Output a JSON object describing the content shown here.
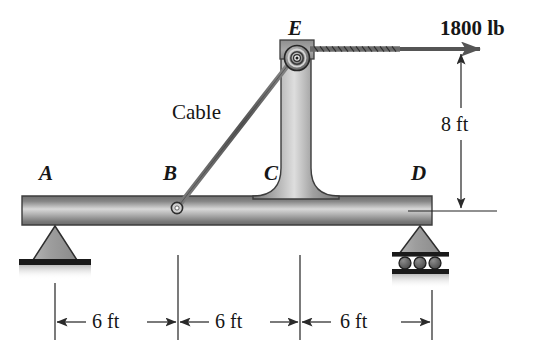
{
  "figure": {
    "type": "free-body-diagram",
    "point_labels": [
      {
        "name": "A",
        "text": "A",
        "x": 39,
        "y": 173
      },
      {
        "name": "B",
        "text": "B",
        "x": 163,
        "y": 173
      },
      {
        "name": "C",
        "text": "C",
        "x": 264,
        "y": 173
      },
      {
        "name": "D",
        "text": "D",
        "x": 411,
        "y": 173
      },
      {
        "name": "E",
        "text": "E",
        "x": 288,
        "y": 22
      }
    ],
    "cable_label": {
      "text": "Cable",
      "x": 175,
      "y": 108
    },
    "force_label": {
      "text": "1800 lb",
      "x": 443,
      "y": 24
    },
    "vertical_dimension": {
      "text": "8 ft",
      "x": 450,
      "y": 125
    },
    "horizontal_dimensions": [
      {
        "text": "6 ft",
        "x": 100,
        "y": 310
      },
      {
        "text": "6 ft",
        "x": 223,
        "y": 310
      },
      {
        "text": "6 ft",
        "x": 345,
        "y": 310
      }
    ],
    "colors": {
      "outline": "#3a3a3a",
      "metal_dark": "#6d6d6d",
      "metal_light": "#e6e6e6",
      "metal_mid": "#9a9a9a",
      "support_fill": "#9d9d9d",
      "ground": "#1c1c1c",
      "cable": "#5a5a5a",
      "dimension_line": "#222222",
      "text": "#161616"
    },
    "geometry": {
      "beam": {
        "x1": 22,
        "y1": 196,
        "x2": 432,
        "y2": 225
      },
      "column": {
        "x1": 281,
        "y1": 42,
        "x2": 311,
        "y2": 196
      },
      "pulley": {
        "cx": 297,
        "cy": 58,
        "r_outer": 12,
        "r_inner": 4
      },
      "cable_anchor": {
        "cx": 177,
        "cy": 208,
        "r": 5
      },
      "force_arrow": {
        "x1": 311,
        "y1": 49,
        "x2": 486,
        "y2": 49
      },
      "support_a": {
        "cx": 55,
        "cy": 225
      },
      "support_d": {
        "cx": 420,
        "cy": 225
      },
      "extension_lines_x": [
        55,
        178,
        300,
        432
      ],
      "dimension_row_y": 322
    }
  }
}
